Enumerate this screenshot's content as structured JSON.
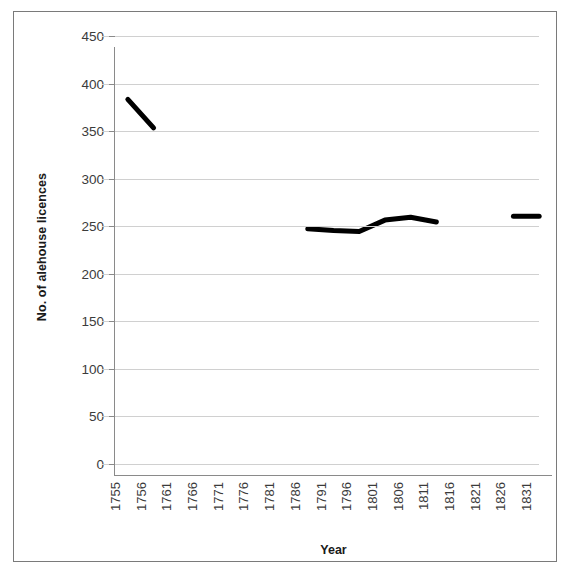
{
  "chart_data": {
    "type": "line",
    "title": "",
    "xlabel": "Year",
    "ylabel": "No. of alehouse licences",
    "categories": [
      "1755",
      "1756",
      "1761",
      "1766",
      "1771",
      "1776",
      "1781",
      "1786",
      "1791",
      "1796",
      "1801",
      "1806",
      "1811",
      "1816",
      "1821",
      "1826",
      "1831"
    ],
    "ylim": [
      0,
      450
    ],
    "yticks": [
      0,
      50,
      100,
      150,
      200,
      250,
      300,
      350,
      400,
      450
    ],
    "grid": true,
    "legend": false,
    "series": [
      {
        "name": "No. of alehouse licences",
        "values": [
          395,
          365,
          null,
          null,
          null,
          null,
          null,
          259,
          257,
          256,
          268,
          271,
          266,
          null,
          null,
          272,
          272
        ]
      }
    ],
    "segments": [
      {
        "name": "segment-1755-1756",
        "points": [
          {
            "x": "1755",
            "y": 395
          },
          {
            "x": "1756",
            "y": 365
          }
        ]
      },
      {
        "name": "segment-1786-1811",
        "points": [
          {
            "x": "1786",
            "y": 259
          },
          {
            "x": "1791",
            "y": 257
          },
          {
            "x": "1796",
            "y": 256
          },
          {
            "x": "1801",
            "y": 268
          },
          {
            "x": "1806",
            "y": 271
          },
          {
            "x": "1811",
            "y": 266
          }
        ]
      },
      {
        "name": "segment-1826-1831",
        "points": [
          {
            "x": "1826",
            "y": 272
          },
          {
            "x": "1831",
            "y": 272
          }
        ]
      }
    ],
    "style": {
      "line_color": "#000000",
      "line_width": 5,
      "grid_color": "#d0d0d0",
      "axis_color": "#8a8a8a",
      "text_color": "#3b3b3b",
      "background": "#ffffff",
      "border_color": "#7a7a7a"
    }
  }
}
